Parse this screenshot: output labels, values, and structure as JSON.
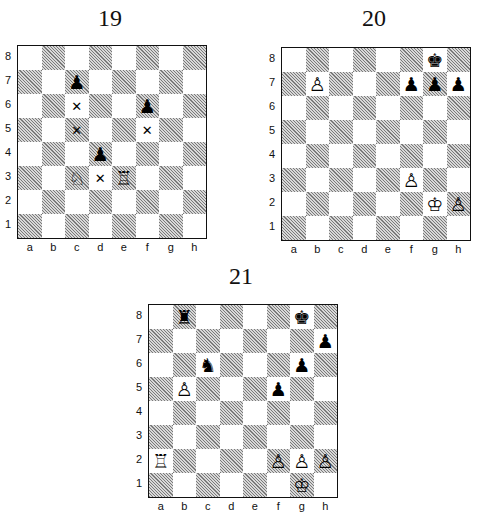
{
  "diagrams": [
    {
      "title": "19",
      "files": [
        "a",
        "b",
        "c",
        "d",
        "e",
        "f",
        "g",
        "h"
      ],
      "ranks": [
        "8",
        "7",
        "6",
        "5",
        "4",
        "3",
        "2",
        "1"
      ],
      "pieces": [
        {
          "square": "c7",
          "color": "black",
          "type": "pawn",
          "glyph": "♟"
        },
        {
          "square": "f6",
          "color": "black",
          "type": "pawn",
          "glyph": "♟"
        },
        {
          "square": "d4",
          "color": "black",
          "type": "pawn",
          "glyph": "♟"
        },
        {
          "square": "c3",
          "color": "white",
          "type": "knight",
          "glyph": "♘"
        },
        {
          "square": "e3",
          "color": "white",
          "type": "rook",
          "glyph": "♖"
        }
      ],
      "marks": [
        {
          "square": "c6",
          "glyph": "✕"
        },
        {
          "square": "c5",
          "glyph": "✕"
        },
        {
          "square": "f5",
          "glyph": "✕"
        },
        {
          "square": "d3",
          "glyph": "✕"
        }
      ]
    },
    {
      "title": "20",
      "files": [
        "a",
        "b",
        "c",
        "d",
        "e",
        "f",
        "g",
        "h"
      ],
      "ranks": [
        "8",
        "7",
        "6",
        "5",
        "4",
        "3",
        "2",
        "1"
      ],
      "pieces": [
        {
          "square": "g8",
          "color": "black",
          "type": "king",
          "glyph": "♚"
        },
        {
          "square": "b7",
          "color": "white",
          "type": "pawn",
          "glyph": "♙"
        },
        {
          "square": "f7",
          "color": "black",
          "type": "pawn",
          "glyph": "♟"
        },
        {
          "square": "g7",
          "color": "black",
          "type": "pawn",
          "glyph": "♟"
        },
        {
          "square": "h7",
          "color": "black",
          "type": "pawn",
          "glyph": "♟"
        },
        {
          "square": "f3",
          "color": "white",
          "type": "pawn",
          "glyph": "♙"
        },
        {
          "square": "g2",
          "color": "white",
          "type": "king",
          "glyph": "♔"
        },
        {
          "square": "h2",
          "color": "white",
          "type": "pawn",
          "glyph": "♙"
        }
      ],
      "marks": []
    },
    {
      "title": "21",
      "files": [
        "a",
        "b",
        "c",
        "d",
        "e",
        "f",
        "g",
        "h"
      ],
      "ranks": [
        "8",
        "7",
        "6",
        "5",
        "4",
        "3",
        "2",
        "1"
      ],
      "pieces": [
        {
          "square": "b8",
          "color": "black",
          "type": "rook",
          "glyph": "♜"
        },
        {
          "square": "g8",
          "color": "black",
          "type": "king",
          "glyph": "♚"
        },
        {
          "square": "h7",
          "color": "black",
          "type": "pawn",
          "glyph": "♟"
        },
        {
          "square": "c6",
          "color": "black",
          "type": "knight",
          "glyph": "♞"
        },
        {
          "square": "g6",
          "color": "black",
          "type": "pawn",
          "glyph": "♟"
        },
        {
          "square": "b5",
          "color": "white",
          "type": "pawn",
          "glyph": "♙"
        },
        {
          "square": "f5",
          "color": "black",
          "type": "pawn",
          "glyph": "♟"
        },
        {
          "square": "a2",
          "color": "white",
          "type": "rook",
          "glyph": "♖"
        },
        {
          "square": "f2",
          "color": "white",
          "type": "pawn",
          "glyph": "♙"
        },
        {
          "square": "g2",
          "color": "white",
          "type": "pawn",
          "glyph": "♙"
        },
        {
          "square": "h2",
          "color": "white",
          "type": "pawn",
          "glyph": "♙"
        },
        {
          "square": "g1",
          "color": "white",
          "type": "king",
          "glyph": "♔"
        }
      ],
      "marks": []
    }
  ]
}
